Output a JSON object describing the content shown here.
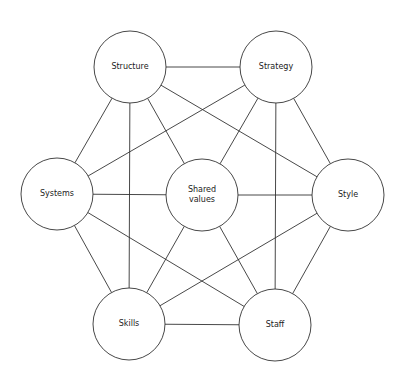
{
  "diagram": {
    "type": "network",
    "title": "",
    "nodes": [
      {
        "id": "structure",
        "label": "Structure",
        "x": 130,
        "y": 67
      },
      {
        "id": "strategy",
        "label": "Strategy",
        "x": 276,
        "y": 67
      },
      {
        "id": "systems",
        "label": "Systems",
        "x": 57,
        "y": 194
      },
      {
        "id": "shared",
        "label": "Shared values",
        "x": 202,
        "y": 195
      },
      {
        "id": "style",
        "label": "Style",
        "x": 348,
        "y": 195
      },
      {
        "id": "skills",
        "label": "Skills",
        "x": 129,
        "y": 324
      },
      {
        "id": "staff",
        "label": "Staff",
        "x": 275,
        "y": 325
      }
    ],
    "edges": [
      [
        "structure",
        "strategy"
      ],
      [
        "structure",
        "systems"
      ],
      [
        "structure",
        "skills"
      ],
      [
        "structure",
        "shared"
      ],
      [
        "structure",
        "style"
      ],
      [
        "strategy",
        "systems"
      ],
      [
        "strategy",
        "shared"
      ],
      [
        "strategy",
        "staff"
      ],
      [
        "strategy",
        "style"
      ],
      [
        "systems",
        "shared"
      ],
      [
        "systems",
        "skills"
      ],
      [
        "systems",
        "staff"
      ],
      [
        "shared",
        "style"
      ],
      [
        "shared",
        "skills"
      ],
      [
        "shared",
        "staff"
      ],
      [
        "style",
        "skills"
      ],
      [
        "style",
        "staff"
      ],
      [
        "skills",
        "staff"
      ]
    ],
    "radius": 36,
    "colors": {
      "line": "#333333",
      "fill": "#ffffff",
      "text": "#222222"
    }
  }
}
